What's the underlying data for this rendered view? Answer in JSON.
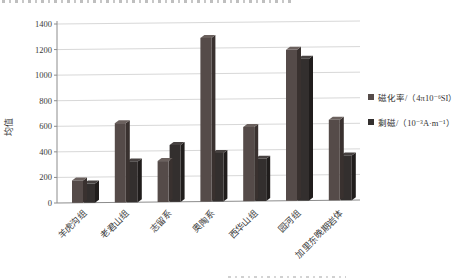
{
  "chart_data": {
    "type": "bar",
    "style": "3d-clustered",
    "title": "",
    "xlabel": "",
    "ylabel": "均值",
    "ylim": [
      0,
      1400
    ],
    "yticks": [
      0,
      200,
      400,
      600,
      800,
      1000,
      1200,
      1400
    ],
    "categories": [
      "羊虎沟组",
      "老君山组",
      "志留系",
      "奥陶系",
      "西华山组",
      "园河组",
      "加里东晚期岩体"
    ],
    "series": [
      {
        "name": "磁化率/（4π10⁻⁶SI）",
        "color": "#554b49",
        "side_color": "#39312f",
        "top_color": "#6b615e",
        "values": [
          175,
          620,
          320,
          1280,
          580,
          1180,
          630
        ]
      },
      {
        "name": "剩磁/（10⁻³A·m⁻¹）",
        "color": "#332f2e",
        "side_color": "#201d1c",
        "top_color": "#474241",
        "values": [
          150,
          320,
          445,
          380,
          330,
          1110,
          350
        ]
      }
    ],
    "legend_position": "right",
    "grid": true,
    "gridline_color": "#d8d8d8",
    "axis_color": "#8c8c8c",
    "text_color": "#3a3a3a"
  }
}
